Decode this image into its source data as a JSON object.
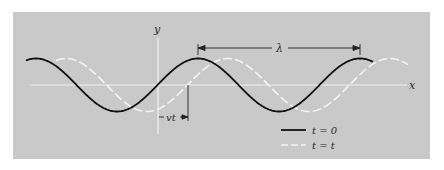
{
  "figure": {
    "background_color": "#c9c9c9",
    "axis_color": "#f2f2f2",
    "curve_t0_color": "#111111",
    "curve_tt_color": "#f4f4f4",
    "axes": {
      "x_label": "x",
      "y_label": "y"
    },
    "annotations": {
      "wavelength_label": "λ",
      "displacement_label": "vt"
    },
    "legend": [
      {
        "label": "t = 0",
        "style": "solid",
        "color": "#111111"
      },
      {
        "label": "t = t",
        "style": "dashed",
        "color": "#f4f4f4"
      }
    ]
  }
}
